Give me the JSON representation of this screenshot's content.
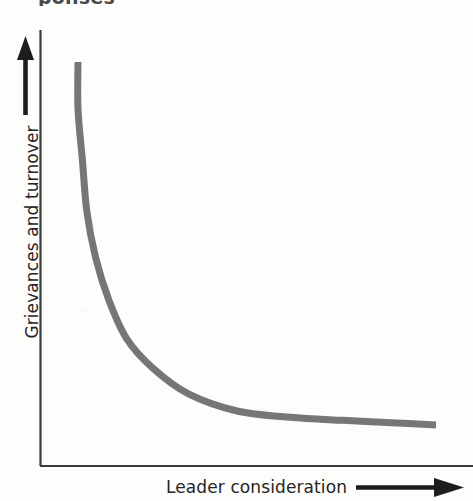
{
  "figure": {
    "title_fragment": "ponses",
    "background_color": "#fdfdfc"
  },
  "chart_data": {
    "type": "line",
    "title": "",
    "xlabel": "Leader consideration",
    "ylabel": "Grievances and turnover",
    "grid": false,
    "legend": null,
    "axes": {
      "x_arrow": true,
      "y_arrow": true,
      "x_ticks": [],
      "y_ticks": [],
      "xlim": [
        0,
        1
      ],
      "ylim": [
        0,
        1
      ]
    },
    "annotations": [],
    "series": [
      {
        "name": "Grievances and turnover vs leader consideration",
        "color": "#767676",
        "line_width": 7,
        "shape": "steep-decay-then-flat",
        "x": [
          0.1,
          0.1,
          0.11,
          0.12,
          0.14,
          0.17,
          0.21,
          0.27,
          0.35,
          0.46,
          0.58,
          0.7,
          0.82,
          0.91
        ],
        "y": [
          0.93,
          0.82,
          0.7,
          0.58,
          0.47,
          0.37,
          0.28,
          0.21,
          0.15,
          0.11,
          0.095,
          0.088,
          0.082,
          0.077
        ]
      }
    ]
  },
  "icons": {
    "y_axis_arrow": "arrow-up-icon",
    "x_axis_arrow": "arrow-right-icon"
  },
  "colors": {
    "curve": "#767676",
    "axis": "#3a3a3a",
    "text": "#252525"
  }
}
